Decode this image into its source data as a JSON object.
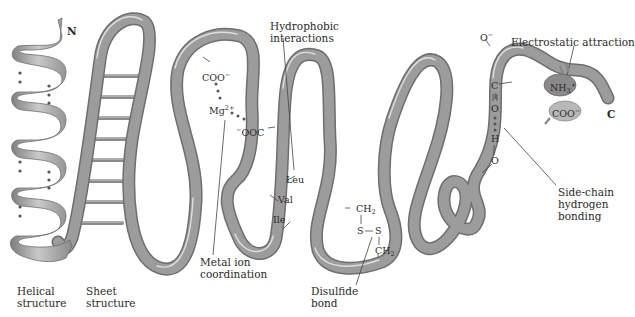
{
  "figure": {
    "terminals": {
      "n": "N",
      "c": "C"
    },
    "labels": {
      "helical_1": "Helical",
      "helical_2": "structure",
      "sheet_1": "Sheet",
      "sheet_2": "structure",
      "metal_1": "Metal ion",
      "metal_2": "coordination",
      "hydrophobic_1": "Hydrophobic",
      "hydrophobic_2": "interactions",
      "disulfide_1": "Disulfide",
      "disulfide_2": "bond",
      "electrostatic": "Electrostatic attraction",
      "sidechain_1": "Side-chain",
      "sidechain_2": "hydrogen",
      "sidechain_3": "bonding"
    },
    "chemistry": {
      "coo_top": "COO",
      "coo_top_charge": "−",
      "mg": "Mg",
      "mg_charge": "2+",
      "ooc_charge": "−",
      "ooc": "OOC",
      "leu": "Leu",
      "val": "Val",
      "ile": "Ile",
      "ch2_a": "CH",
      "ch2_a_sub": "2",
      "s1": "S",
      "s2": "S",
      "ch2_b": "CH",
      "ch2_b_sub": "2",
      "o_minus": "O",
      "o_minus_charge": "−",
      "c": "C",
      "o_double": "O",
      "h": "H",
      "o_bottom": "O",
      "nh3": "NH",
      "nh3_sub": "3",
      "nh3_charge": "+",
      "coo_right": "COO",
      "coo_right_charge": "−"
    },
    "colors": {
      "ribbon": "#9a9a9a",
      "ribbon_edge": "#6e6e6e",
      "ribbon_highlight": "#d9d9d9",
      "nh3_blob": "#8a8a8a",
      "coo_blob": "#b5b5b5",
      "text": "#2a2a2a"
    }
  }
}
